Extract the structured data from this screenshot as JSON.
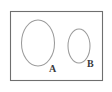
{
  "figure": {
    "type": "venn-like-region-diagram",
    "background_color": "#ffffff",
    "frame": {
      "name": "bounding-box",
      "stroke_color": "#6f6f6f",
      "fill_color": "#ffffff",
      "x": 10,
      "y": 11,
      "width": 93,
      "height": 70
    },
    "shapes": [
      {
        "id": "ellipse-a",
        "label": "A",
        "stroke_color": "#9b9b9b",
        "fill_color": "none",
        "center_x": 38,
        "center_y": 43,
        "radius_x": 16.5,
        "radius_y": 23,
        "label_x": 52,
        "label_y": 72
      },
      {
        "id": "ellipse-b",
        "label": "B",
        "stroke_color": "#9b9b9b",
        "fill_color": "none",
        "center_x": 79,
        "center_y": 46,
        "radius_x": 11,
        "radius_y": 17,
        "label_x": 89,
        "label_y": 67
      }
    ]
  }
}
